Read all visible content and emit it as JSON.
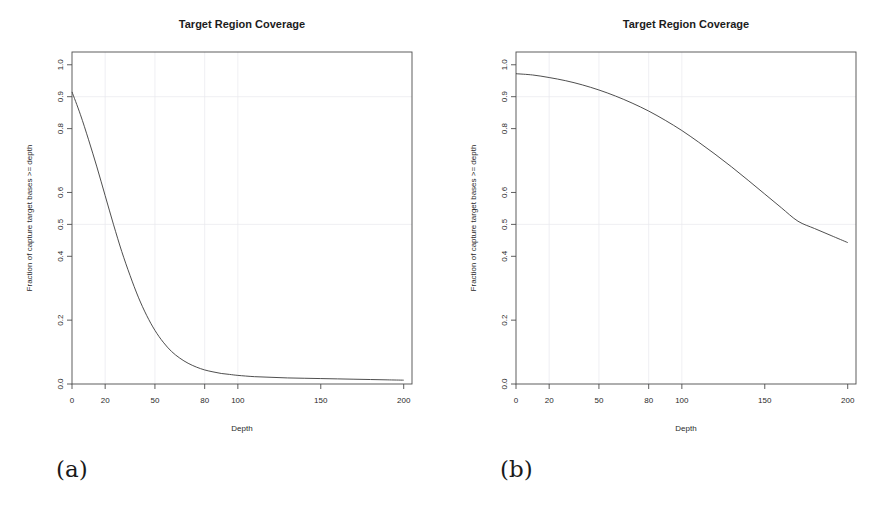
{
  "figure": {
    "caption_a": "(a)",
    "caption_b": "(b)"
  },
  "chart_data": [
    {
      "panel": "a",
      "type": "line",
      "title": "Target Region Coverage",
      "xlabel": "Depth",
      "ylabel": "Fraction of capture target bases >= depth",
      "xlim": [
        0,
        205
      ],
      "ylim": [
        0.0,
        1.04
      ],
      "xticks": [
        0,
        20,
        50,
        80,
        100,
        150,
        200
      ],
      "xtick_labels": [
        "0",
        "20",
        "50",
        "80",
        "100",
        "150",
        "200"
      ],
      "yticks": [
        0.0,
        0.2,
        0.4,
        0.5,
        0.6,
        0.8,
        0.9,
        1.0
      ],
      "ytick_labels": [
        "0.0",
        "0.2",
        "0.4",
        "0.5",
        "0.6",
        "0.8",
        "0.9",
        "1.0"
      ],
      "grid": true,
      "grid_axis": "x",
      "legend": "none",
      "line_color": "#3a3a3a",
      "x": [
        0,
        5,
        10,
        15,
        20,
        25,
        30,
        35,
        40,
        45,
        50,
        55,
        60,
        65,
        70,
        75,
        80,
        85,
        90,
        95,
        100,
        110,
        120,
        130,
        140,
        150,
        160,
        170,
        180,
        190,
        200
      ],
      "y": [
        0.915,
        0.845,
        0.765,
        0.68,
        0.59,
        0.5,
        0.415,
        0.34,
        0.272,
        0.215,
        0.168,
        0.131,
        0.102,
        0.081,
        0.065,
        0.053,
        0.044,
        0.038,
        0.033,
        0.03,
        0.027,
        0.023,
        0.021,
        0.019,
        0.018,
        0.017,
        0.016,
        0.015,
        0.014,
        0.013,
        0.012
      ]
    },
    {
      "panel": "b",
      "type": "line",
      "title": "Target Region Coverage",
      "xlabel": "Depth",
      "ylabel": "Fraction of capture target bases >= depth",
      "xlim": [
        0,
        205
      ],
      "ylim": [
        0.0,
        1.04
      ],
      "xticks": [
        0,
        20,
        50,
        80,
        100,
        150,
        200
      ],
      "xtick_labels": [
        "0",
        "20",
        "50",
        "80",
        "100",
        "150",
        "200"
      ],
      "yticks": [
        0.0,
        0.2,
        0.4,
        0.5,
        0.6,
        0.8,
        0.9,
        1.0
      ],
      "ytick_labels": [
        "0.0",
        "0.2",
        "0.4",
        "0.5",
        "0.6",
        "0.8",
        "0.9",
        "1.0"
      ],
      "grid": true,
      "grid_axis": "x",
      "legend": "none",
      "line_color": "#3a3a3a",
      "x": [
        0,
        10,
        20,
        30,
        40,
        50,
        60,
        70,
        80,
        90,
        100,
        110,
        120,
        130,
        140,
        150,
        160,
        170,
        180,
        190,
        200
      ],
      "y": [
        0.972,
        0.968,
        0.96,
        0.95,
        0.937,
        0.921,
        0.902,
        0.88,
        0.855,
        0.826,
        0.794,
        0.758,
        0.72,
        0.68,
        0.638,
        0.595,
        0.552,
        0.51,
        0.487,
        0.465,
        0.443
      ]
    }
  ]
}
